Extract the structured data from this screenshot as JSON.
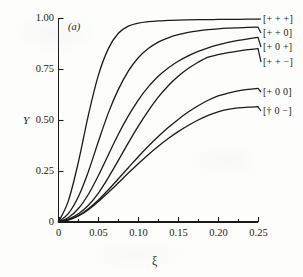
{
  "figure": {
    "panel_label": "(a)",
    "background_color": "#fdfdfc",
    "line_color": "#1a1a1a"
  },
  "chart_data": {
    "type": "line",
    "title": "",
    "subtitle": "",
    "panel": "(a)",
    "xlabel": "ξ",
    "ylabel": "Y",
    "xlim": [
      0,
      0.25
    ],
    "ylim": [
      0,
      1.0
    ],
    "grid": false,
    "legend_position": "right-inline-labels",
    "x_ticks": [
      0,
      0.05,
      0.1,
      0.15,
      0.2,
      0.25
    ],
    "x_tick_labels": [
      "0",
      "0.05",
      "0.10",
      "0.15",
      "0.20",
      "0.25"
    ],
    "x_minor_ticks": [
      0.025,
      0.075,
      0.125,
      0.175,
      0.225
    ],
    "y_ticks": [
      0,
      0.25,
      0.5,
      0.75,
      1.0
    ],
    "y_tick_labels": [
      "0",
      "0.25",
      "0.50",
      "0.75",
      "1.00"
    ],
    "x": [
      0,
      0.0125,
      0.025,
      0.0375,
      0.05,
      0.0625,
      0.075,
      0.0875,
      0.1,
      0.1125,
      0.125,
      0.1375,
      0.15,
      0.1625,
      0.175,
      0.1875,
      0.2,
      0.2125,
      0.225,
      0.2375,
      0.25
    ],
    "series": [
      {
        "name": "[+ + +]",
        "label": "[+ + +]",
        "end_value": 0.99,
        "values": [
          0,
          0.105,
          0.295,
          0.525,
          0.72,
          0.85,
          0.925,
          0.96,
          0.975,
          0.982,
          0.986,
          0.988,
          0.99,
          0.991,
          0.992,
          0.992,
          0.993,
          0.993,
          0.993,
          0.994,
          0.994
        ]
      },
      {
        "name": "[+ + 0]",
        "label": "[+ + 0]",
        "end_value": 0.955,
        "values": [
          0,
          0.042,
          0.125,
          0.248,
          0.395,
          0.535,
          0.65,
          0.74,
          0.805,
          0.85,
          0.882,
          0.903,
          0.918,
          0.929,
          0.937,
          0.943,
          0.947,
          0.95,
          0.952,
          0.954,
          0.955
        ]
      },
      {
        "name": "[+ 0 +]",
        "label": "[+ 0 +]",
        "end_value": 0.905,
        "values": [
          0,
          0.022,
          0.066,
          0.136,
          0.228,
          0.33,
          0.43,
          0.52,
          0.598,
          0.662,
          0.714,
          0.755,
          0.788,
          0.814,
          0.836,
          0.854,
          0.868,
          0.88,
          0.89,
          0.898,
          0.905
        ]
      },
      {
        "name": "[+ + -]",
        "label": "[+ + −]",
        "end_value": 0.85,
        "values": [
          0,
          0.014,
          0.04,
          0.082,
          0.142,
          0.218,
          0.302,
          0.388,
          0.47,
          0.545,
          0.612,
          0.668,
          0.714,
          0.752,
          0.783,
          0.808,
          0.82,
          0.83,
          0.838,
          0.845,
          0.85
        ]
      },
      {
        "name": "[+ 0 0]",
        "label": "[+ 0 0]",
        "end_value": 0.655,
        "values": [
          0,
          0.011,
          0.032,
          0.065,
          0.108,
          0.158,
          0.212,
          0.266,
          0.32,
          0.371,
          0.419,
          0.463,
          0.503,
          0.539,
          0.57,
          0.597,
          0.618,
          0.632,
          0.643,
          0.65,
          0.655
        ]
      },
      {
        "name": "[+ 0 -]",
        "label": "[† 0 −]",
        "end_value": 0.565,
        "values": [
          0,
          0.01,
          0.03,
          0.06,
          0.1,
          0.145,
          0.192,
          0.24,
          0.286,
          0.33,
          0.371,
          0.409,
          0.443,
          0.473,
          0.5,
          0.523,
          0.54,
          0.552,
          0.559,
          0.563,
          0.565
        ]
      }
    ]
  }
}
